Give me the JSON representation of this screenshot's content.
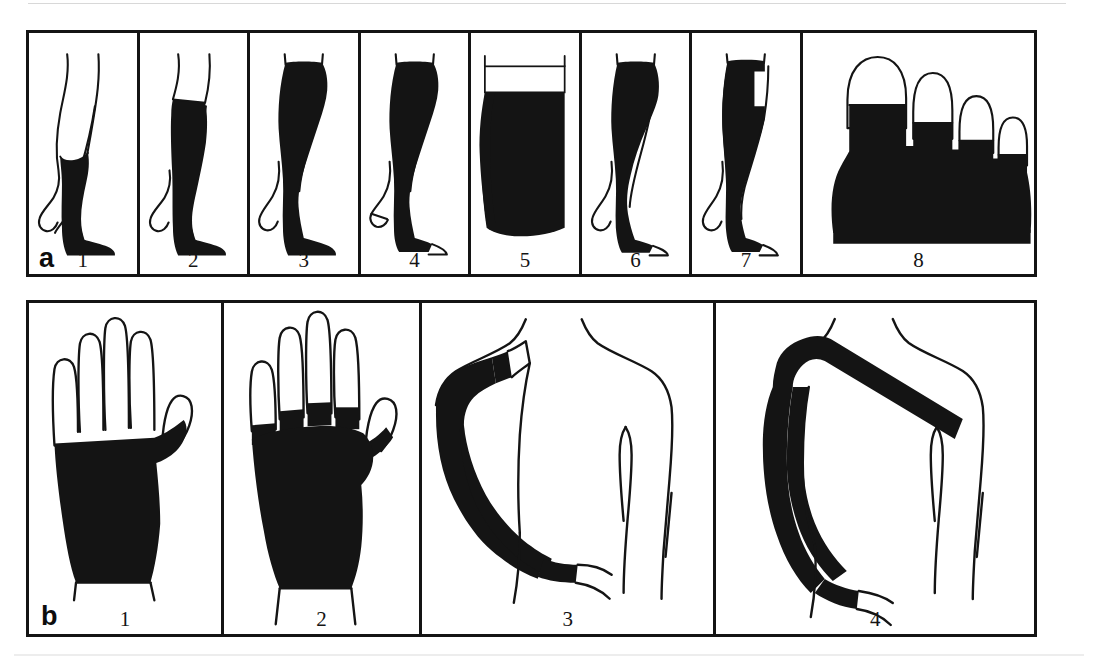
{
  "figure": {
    "type": "medical-illustration",
    "background_color": "#ffffff",
    "ink_color": "#141414"
  },
  "panels": [
    {
      "label": "a",
      "region": "lower limb",
      "cells": [
        {
          "number": "1",
          "name": "below-knee-stocking",
          "description": "below-knee compression stocking, closed toe"
        },
        {
          "number": "2",
          "name": "thigh-high-stocking",
          "description": "thigh-high compression stocking, closed toe"
        },
        {
          "number": "3",
          "name": "pantyhose-closed-toe",
          "description": "compression pantyhose / tights, closed toe"
        },
        {
          "number": "4",
          "name": "pantyhose-open-toe",
          "description": "compression pantyhose / tights, open toe"
        },
        {
          "number": "5",
          "name": "thigh-silicone-band",
          "description": "thigh garment close-up with dotted silicone grip band"
        },
        {
          "number": "6",
          "name": "one-leg-tights",
          "description": "single-leg compression tights with waist panel, open toe"
        },
        {
          "number": "7",
          "name": "one-leg-tights-waist-attachment",
          "description": "single-leg compression tights with waist attachment, open toe"
        },
        {
          "number": "8",
          "name": "toe-cap",
          "description": "compression toe cap covering forefoot and toes"
        }
      ]
    },
    {
      "label": "b",
      "region": "upper limb",
      "cells": [
        {
          "number": "1",
          "name": "hand-gauntlet",
          "description": "compression hand gauntlet without finger coverage"
        },
        {
          "number": "2",
          "name": "compression-glove",
          "description": "compression glove with partial finger stubs"
        },
        {
          "number": "3",
          "name": "arm-sleeve",
          "description": "compression arm sleeve to upper arm"
        },
        {
          "number": "4",
          "name": "arm-sleeve-shoulder-strap",
          "description": "compression arm sleeve with shoulder strap"
        }
      ]
    }
  ]
}
